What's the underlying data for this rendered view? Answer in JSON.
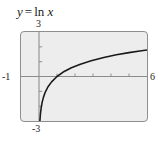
{
  "figure": {
    "title_parts": {
      "y": "y",
      "equals": "=",
      "fn": "ln",
      "x": "x"
    },
    "title_text": "y = ln x",
    "background_color": "#ffffff",
    "plot_background_color": "#ededed",
    "frame_color": "#8e8e8e",
    "curve_color": "#1a1a1a",
    "axis_color": "#8c8c8c"
  },
  "chart_data": {
    "type": "line",
    "xlabel": "",
    "ylabel": "",
    "function": "y = ln x",
    "xlim": [
      -1,
      6
    ],
    "ylim": [
      -3,
      3
    ],
    "grid": false,
    "legend": null,
    "axis_tick_labels": {
      "x_left": "-1",
      "x_right": "6",
      "y_top": "3",
      "y_bottom": "-3"
    },
    "x_ticks": [
      1,
      2,
      3,
      4,
      5
    ],
    "y_ticks": [
      -2,
      -1,
      1,
      2
    ],
    "x_intercept": 1,
    "series": [
      {
        "name": "y = ln x",
        "x": [
          0.05,
          0.08,
          0.12,
          0.18,
          0.25,
          0.35,
          0.5,
          0.7,
          1.0,
          1.4,
          1.8,
          2.3,
          2.9,
          3.6,
          4.3,
          5.0,
          5.6,
          6.0
        ],
        "values": [
          -3.0,
          -2.53,
          -2.12,
          -1.71,
          -1.39,
          -1.05,
          -0.69,
          -0.36,
          0.0,
          0.34,
          0.59,
          0.83,
          1.06,
          1.28,
          1.46,
          1.61,
          1.72,
          1.79
        ]
      }
    ]
  }
}
